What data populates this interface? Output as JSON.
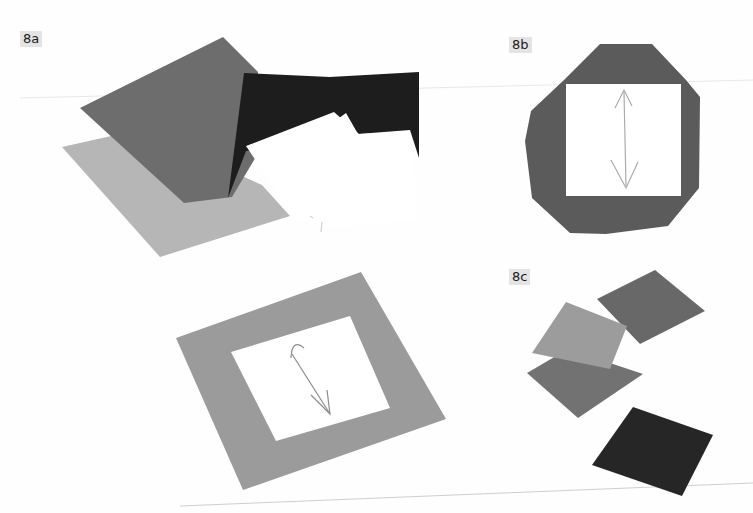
{
  "figure": {
    "panels": [
      {
        "id": "8a",
        "label": "8a",
        "description": "Stack of felt squares in various shades with a white paper template",
        "colors": {
          "mid_gray_square": "#6e6e6e",
          "light_gray_square": "#b5b5b5",
          "black_square": "#1c1c1c",
          "white_template": "#ffffff"
        }
      },
      {
        "id": "8b",
        "label": "8b",
        "description": "Octagonal dark felt piece with white square template and double-headed arrow",
        "colors": {
          "felt": "#5a5a5a",
          "template": "#ffffff",
          "arrow": "#a9a9a9"
        }
      },
      {
        "id": "8c",
        "label": "8c",
        "description": "Four cut felt squares in different tones",
        "colors": {
          "top_right_square": "#676767",
          "light_square": "#9b9b9b",
          "middle_square": "#717171",
          "bottom_black_square": "#262626"
        }
      },
      {
        "id": "8a-frame",
        "label": "",
        "description": "Gray felt square with white square template and diagonal double-headed arrow",
        "colors": {
          "felt": "#9a9a9a",
          "template": "#ffffff",
          "arrow": "#8a8a8a"
        }
      }
    ]
  }
}
